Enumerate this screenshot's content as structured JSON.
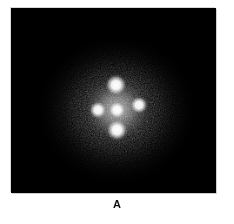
{
  "figure": {
    "caption_label": "A",
    "panel": {
      "name": "fluorescence-micrograph",
      "background_color": "#000000",
      "border_color": "#d8d8d8",
      "left": 11,
      "top": 8,
      "width": 205,
      "height": 185
    },
    "page_background_color": "#ffffff",
    "caption_color": "#111111"
  },
  "chart_data": {
    "type": "scatter",
    "title": "A",
    "subtitle": "",
    "xlabel": "",
    "ylabel": "",
    "grid": false,
    "legend_position": "none",
    "units": "pixels",
    "xlim": [
      0,
      205
    ],
    "ylim": [
      0,
      185
    ],
    "background_color": "#000000",
    "spot_color": "#ffffff",
    "halo_color": "#9a9a9a",
    "series": [
      {
        "name": "bright-spots",
        "points": [
          {
            "label": "top",
            "x": 105,
            "y": 77,
            "radius": 11,
            "peak_intensity": 255
          },
          {
            "label": "left",
            "x": 87,
            "y": 102,
            "radius": 9,
            "peak_intensity": 250
          },
          {
            "label": "center",
            "x": 106,
            "y": 102,
            "radius": 9,
            "peak_intensity": 247
          },
          {
            "label": "right",
            "x": 128,
            "y": 97,
            "radius": 9,
            "peak_intensity": 250
          },
          {
            "label": "bottom",
            "x": 106,
            "y": 122,
            "radius": 11,
            "peak_intensity": 255
          }
        ]
      },
      {
        "name": "diffuse-halo",
        "points": [
          {
            "label": "halo-center",
            "x": 106,
            "y": 102,
            "radius": 58,
            "peak_intensity": 110
          }
        ]
      }
    ],
    "annotations": [
      {
        "text": "A",
        "x": 106,
        "y": 198,
        "style": "bold",
        "role": "panel-label"
      }
    ]
  }
}
